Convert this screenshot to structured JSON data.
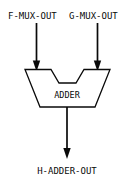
{
  "diagram": {
    "background_color": "#ffffff",
    "line_color": "#0a0a0a",
    "text_color": "#0a0a0a",
    "inputs": [
      {
        "label": "F-MUX-OUT",
        "position": "top-left"
      },
      {
        "label": "G-MUX-OUT",
        "position": "top-right"
      }
    ],
    "block": {
      "label": "ADDER",
      "shape": "notched-trapezoid",
      "top_width_px": 85,
      "bottom_width_px": 55,
      "height_px": 38
    },
    "outputs": [
      {
        "label": "H-ADDER-OUT",
        "position": "bottom-center"
      }
    ],
    "connectors": [
      {
        "name": "f-mux-out-to-adder",
        "direction": "down",
        "arrowhead": "filled-triangle"
      },
      {
        "name": "g-mux-out-to-adder",
        "direction": "down",
        "arrowhead": "filled-triangle"
      },
      {
        "name": "adder-to-h-adder-out",
        "direction": "down",
        "arrowhead": "filled-triangle"
      }
    ]
  }
}
